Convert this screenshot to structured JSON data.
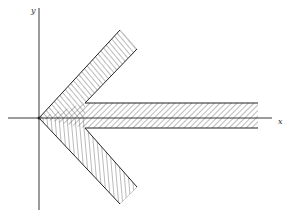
{
  "diagram": {
    "axes": {
      "x_label": "x",
      "y_label": "y"
    },
    "shape": "hatched arrow pointing left with apex at origin",
    "colors": {
      "line": "#222222",
      "hatch": "#555555",
      "background": "#ffffff"
    }
  }
}
